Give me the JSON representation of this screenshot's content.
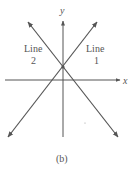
{
  "figure": {
    "caption": "(b)",
    "axes": {
      "x_label": "x",
      "y_label": "y"
    },
    "lines": [
      {
        "name": "Line 1",
        "label_word": "Line",
        "label_num": "1",
        "slope_sign": "positive"
      },
      {
        "name": "Line 2",
        "label_word": "Line",
        "label_num": "2",
        "slope_sign": "negative"
      }
    ],
    "intersection": "on positive y-axis",
    "colors": {
      "line": "#555555",
      "text": "#555555",
      "background": "#ffffff"
    }
  }
}
